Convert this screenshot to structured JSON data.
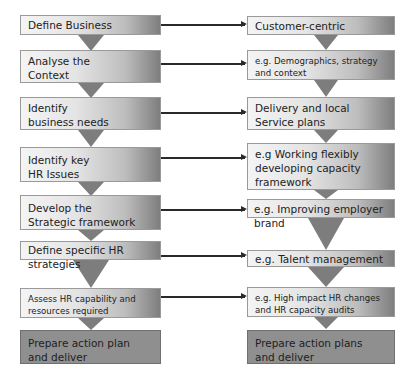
{
  "left_column": {
    "steps": [
      {
        "label": "Define Business"
      },
      {
        "label": "Analyse the\nContext"
      },
      {
        "label": "Identify\nbusiness needs"
      },
      {
        "label": "Identify key\nHR Issues"
      },
      {
        "label": "Develop the\nStrategic framework"
      },
      {
        "label": "Define specific HR strategies"
      },
      {
        "label": "Assess HR capability and\nresources required"
      },
      {
        "label": "Prepare action plan\nand deliver"
      }
    ]
  },
  "right_column": {
    "steps": [
      {
        "label": "Customer-centric"
      },
      {
        "label": "e.g. Demographics, strategy\nand context"
      },
      {
        "label": "Delivery and local\nService plans"
      },
      {
        "label": "e.g Working flexibly\ndeveloping capacity\nframework"
      },
      {
        "label": "e.g. Improving employer brand"
      },
      {
        "label": "e.g. Talent management"
      },
      {
        "label": "e.g. High impact HR changes\nand HR capacity audits"
      },
      {
        "label": "Prepare action plans\nand deliver"
      }
    ]
  },
  "colors": {
    "box_light": "#f4f4f4",
    "box_dark_end": "#7e7e7e",
    "final_box": "#8f8f8f",
    "funnel": "#7d7d7d",
    "arrow": "#2a2a2a"
  }
}
